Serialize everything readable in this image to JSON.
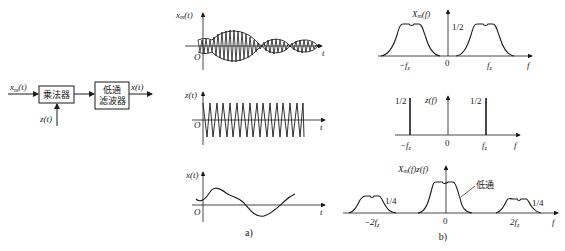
{
  "block_diagram": {
    "input_label": "x_m(t)",
    "input_label_main": "x",
    "input_label_sub": "m",
    "input_label_arg": "(t)",
    "multiplier_label": "乘法器",
    "carrier_label": "z(t)",
    "filter_label_line1": "低通",
    "filter_label_line2": "滤波器",
    "output_label": "x(t)"
  },
  "time_domain": {
    "caption": "a)",
    "plots": [
      {
        "id": "xm",
        "ylabel_main": "x",
        "ylabel_sub": "m",
        "ylabel_arg": "(t)",
        "xlabel": "t",
        "origin": "O",
        "description": "amplitude-modulated signal"
      },
      {
        "id": "z",
        "ylabel": "z(t)",
        "xlabel": "t",
        "origin": "O",
        "description": "carrier triangular oscillation"
      },
      {
        "id": "x",
        "ylabel": "x(t)",
        "xlabel": "t",
        "origin": "O",
        "description": "recovered baseband signal"
      }
    ]
  },
  "freq_domain": {
    "caption": "b)",
    "plots": [
      {
        "id": "Xm",
        "ylabel_main": "X",
        "ylabel_sub": "m",
        "ylabel_arg": "(f)",
        "xlabel": "f",
        "ticks": [
          "-f_z",
          "0",
          "f_z"
        ],
        "tick_neg": "−f",
        "tick_pos": "f",
        "tick_sub": "z",
        "level": "1/2"
      },
      {
        "id": "Z",
        "ylabel": "z(f)",
        "xlabel": "f",
        "tick_neg": "−f",
        "tick_pos": "f",
        "tick_sub": "z",
        "zero": "0",
        "impulse_left": "1/2",
        "impulse_right": "1/2"
      },
      {
        "id": "XmZ",
        "ylabel_main": "X",
        "ylabel_sub": "m",
        "ylabel_arg": "(f)z(f)",
        "xlabel": "f",
        "tick_neg": "−2f",
        "tick_pos": "2f",
        "tick_sub": "z",
        "zero": "0",
        "side_level_left": "1/4",
        "side_level_right": "1/4",
        "lowpass_label": "低通"
      }
    ]
  }
}
